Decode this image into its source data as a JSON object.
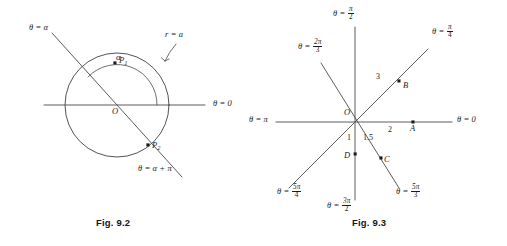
{
  "figures": [
    {
      "id": "fig-9-2",
      "caption": "Fig. 9.2",
      "description": "Circle r = a with a line through the pole at angle alpha meeting the circle at P1 and P2",
      "origin_label": "O",
      "labels": {
        "theta_alpha": "θ = α",
        "theta_alpha_plus_pi_prefix": "θ = α + ",
        "theta_alpha_plus_pi_pi": "π",
        "theta_zero": "θ = 0",
        "radius_label": "r = a",
        "angle_label": "α",
        "point_p1": "P",
        "point_p1_sub": "1",
        "point_p2": "P",
        "point_p2_sub": "2"
      }
    },
    {
      "id": "fig-9-3",
      "caption": "Fig. 9.3",
      "description": "Polar coordinate rays with plotted points A, B, C, D",
      "origin_label": "O",
      "rays": [
        {
          "name": "theta-0",
          "prefix": "θ = ",
          "value": "0",
          "num": "",
          "den": "",
          "angle_deg": 0
        },
        {
          "name": "theta-pi-4",
          "prefix": "θ = ",
          "value": "",
          "num": "π",
          "den": "4",
          "angle_deg": 45
        },
        {
          "name": "theta-pi-2",
          "prefix": "θ = ",
          "value": "",
          "num": "π",
          "den": "2",
          "angle_deg": 90
        },
        {
          "name": "theta-2pi-3",
          "prefix": "θ = ",
          "value": "",
          "num": "2π",
          "den": "3",
          "angle_deg": 120
        },
        {
          "name": "theta-pi",
          "prefix": "θ = ",
          "value": "π",
          "num": "",
          "den": "",
          "angle_deg": 180
        },
        {
          "name": "theta-5pi-4",
          "prefix": "θ = ",
          "value": "",
          "num": "5π",
          "den": "4",
          "angle_deg": 225
        },
        {
          "name": "theta-3pi-2",
          "prefix": "θ = ",
          "value": "",
          "num": "3π",
          "den": "2",
          "angle_deg": 270
        },
        {
          "name": "theta-5pi-3",
          "prefix": "θ = ",
          "value": "",
          "num": "5π",
          "den": "3",
          "angle_deg": 300
        }
      ],
      "points": [
        {
          "label": "A",
          "r": "2",
          "theta": "0"
        },
        {
          "label": "B",
          "r": "3",
          "theta": "π/4"
        },
        {
          "label": "C",
          "r": "1.5",
          "theta": "5π/3"
        },
        {
          "label": "D",
          "r": "1",
          "theta": "3π/2"
        }
      ],
      "radius_marks": [
        "2",
        "3",
        "1.5",
        "1"
      ]
    }
  ],
  "colors": {
    "ink": "#1b1b1b",
    "line": "#4a4a4a",
    "background": "#ffffff"
  }
}
